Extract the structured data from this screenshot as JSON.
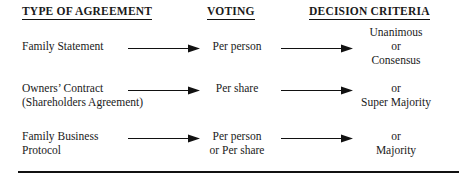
{
  "headers": {
    "col1": "TYPE OF AGREEMENT",
    "col2": "VOTING",
    "col3": "DECISION CRITERIA"
  },
  "rows": [
    {
      "agreement_line1": "Family Statement",
      "agreement_line2": "",
      "voting_line1": "Per person",
      "voting_line2": "",
      "criteria_line1": "Unanimous",
      "criteria_line2": "or",
      "criteria_line3": "Consensus"
    },
    {
      "agreement_line1": "Owners’ Contract",
      "agreement_line2": "(Shareholders Agreement)",
      "voting_line1": "Per share",
      "voting_line2": "",
      "criteria_line1": "",
      "criteria_line2": "or",
      "criteria_line3": "Super Majority"
    },
    {
      "agreement_line1": "Family Business",
      "agreement_line2": "Protocol",
      "voting_line1": "Per person",
      "voting_line2": "or Per share",
      "criteria_line1": "",
      "criteria_line2": "or",
      "criteria_line3": "Majority"
    }
  ],
  "arrows": {
    "label": "arrow-right",
    "color": "#111111"
  },
  "colors": {
    "text": "#1a1a1a",
    "rule": "#111111",
    "background": "#ffffff"
  }
}
